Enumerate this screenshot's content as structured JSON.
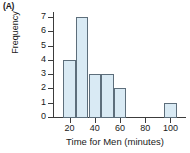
{
  "panel": {
    "label": "(A)"
  },
  "chart_data": {
    "type": "bar",
    "subtype": "histogram",
    "title": "",
    "xlabel": "Time for Men (minutes)",
    "ylabel": "Frequency",
    "xlim": [
      10,
      110
    ],
    "ylim": [
      0,
      7
    ],
    "grid": false,
    "legend": null,
    "bin_width": 10,
    "bin_edges": [
      15,
      25,
      35,
      45,
      55,
      65,
      95,
      105
    ],
    "bins": [
      {
        "start": 15,
        "end": 25,
        "frequency": 4
      },
      {
        "start": 25,
        "end": 35,
        "frequency": 7
      },
      {
        "start": 35,
        "end": 45,
        "frequency": 3
      },
      {
        "start": 45,
        "end": 55,
        "frequency": 3
      },
      {
        "start": 55,
        "end": 65,
        "frequency": 2
      },
      {
        "start": 95,
        "end": 105,
        "frequency": 1
      }
    ],
    "categories": [
      "15-25",
      "25-35",
      "35-45",
      "45-55",
      "55-65",
      "95-105"
    ],
    "values": [
      4,
      7,
      3,
      3,
      2,
      1
    ],
    "xticks": [
      20,
      40,
      60,
      80,
      100
    ],
    "xtick_labels": [
      "20",
      "40",
      "60",
      "80",
      "100"
    ],
    "yticks": [
      0,
      1,
      2,
      3,
      4,
      5,
      6,
      7
    ],
    "ytick_labels": [
      "0",
      "1",
      "2",
      "3",
      "4",
      "5",
      "6",
      "7"
    ],
    "colors": {
      "bar_fill": "#d9eaf4",
      "bar_border": "#5d6e7b",
      "axis": "#3c3c3c",
      "text": "#1a1a1a",
      "background": "#ffffff"
    }
  }
}
